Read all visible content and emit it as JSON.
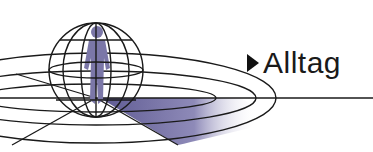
{
  "label": {
    "text": "Alltag",
    "icon": "triangle-right-icon"
  },
  "colors": {
    "line": "#1a1a1a",
    "figure": "#7b77a8",
    "wedge": "#6e6a9e"
  }
}
